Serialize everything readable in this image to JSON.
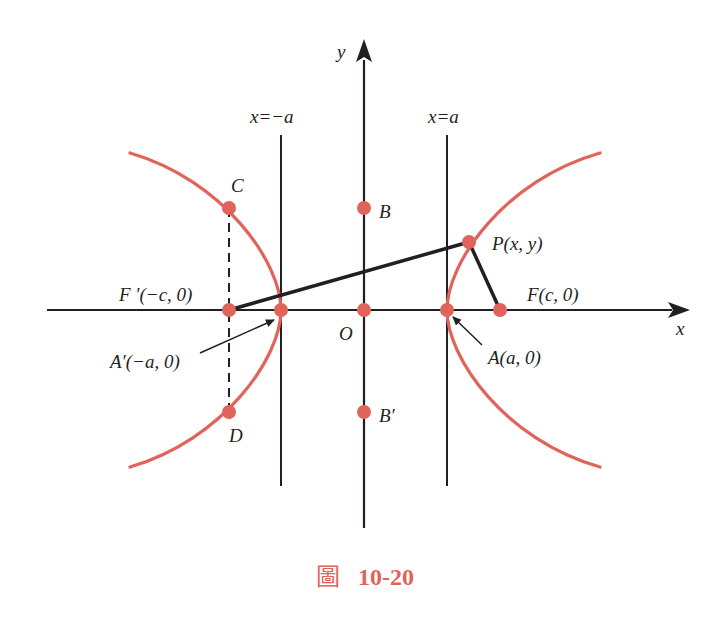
{
  "figure": {
    "caption_prefix": "圖",
    "caption_number": "10-20"
  },
  "colors": {
    "curve": "#e0645a",
    "point": "#e0645a",
    "line": "#231f20",
    "caption": "#e0645a"
  },
  "axes": {
    "x_label": "x",
    "y_label": "y",
    "origin_label": "O"
  },
  "directrices": {
    "left_label": "x=−a",
    "right_label": "x=a"
  },
  "points": {
    "C": {
      "label": "C"
    },
    "D": {
      "label": "D"
    },
    "B": {
      "label": "B"
    },
    "B_prime": {
      "label": "B′"
    },
    "P": {
      "label": "P(x, y)"
    },
    "F": {
      "label": "F(c, 0)"
    },
    "F_prime": {
      "label": "F ′(−c, 0)"
    },
    "A": {
      "label": "A(a, 0)"
    },
    "A_prime": {
      "label": "A′(−a, 0)"
    }
  }
}
